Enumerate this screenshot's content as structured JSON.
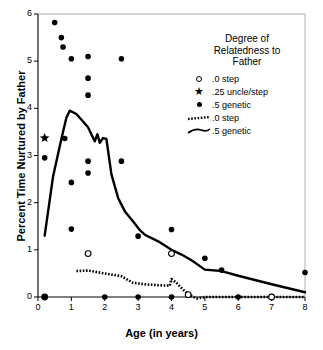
{
  "chart_data": {
    "type": "scatter",
    "title": "",
    "xlabel": "Age (in years)",
    "ylabel": "Percent Time Nurtured by Father",
    "xlim": [
      0,
      8
    ],
    "ylim": [
      0,
      6
    ],
    "xticks": [
      0,
      1,
      2,
      3,
      4,
      5,
      6,
      7,
      8
    ],
    "yticks": [
      0,
      1,
      2,
      3,
      4,
      5,
      6
    ],
    "xtick_labels": [
      "0",
      "1",
      "2",
      "3",
      "4",
      "5",
      "6",
      "7",
      "8"
    ],
    "ytick_labels": [
      "0",
      "1",
      "2",
      "3",
      "4",
      "5",
      "6"
    ],
    "grid": false,
    "legend_position": "upper-right",
    "legend_title": "Degree of\nRelatedness to\nFather",
    "series": [
      {
        "name": ".0 step",
        "marker": "open-circle",
        "type": "scatter",
        "points": [
          [
            0.2,
            0.0
          ],
          [
            1.5,
            0.92
          ],
          [
            4.0,
            0.92
          ],
          [
            4.5,
            0.05
          ],
          [
            7.0,
            0.0
          ]
        ]
      },
      {
        "name": ".25 uncle/step",
        "marker": "star",
        "type": "scatter",
        "points": [
          [
            0.2,
            3.37
          ]
        ]
      },
      {
        "name": ".5 genetic",
        "marker": "filled-circle",
        "type": "scatter",
        "points": [
          [
            0.2,
            0.0
          ],
          [
            0.2,
            2.95
          ],
          [
            0.5,
            5.82
          ],
          [
            0.7,
            5.5
          ],
          [
            0.75,
            5.3
          ],
          [
            0.8,
            3.36
          ],
          [
            1.0,
            5.05
          ],
          [
            1.0,
            2.43
          ],
          [
            1.0,
            1.44
          ],
          [
            1.5,
            5.1
          ],
          [
            1.5,
            4.64
          ],
          [
            1.5,
            4.28
          ],
          [
            1.5,
            2.88
          ],
          [
            1.5,
            2.63
          ],
          [
            2.0,
            0.0
          ],
          [
            2.5,
            5.05
          ],
          [
            2.5,
            2.88
          ],
          [
            3.0,
            1.29
          ],
          [
            3.0,
            0.0
          ],
          [
            4.0,
            1.43
          ],
          [
            4.0,
            0.0
          ],
          [
            5.0,
            0.82
          ],
          [
            5.5,
            0.57
          ],
          [
            6.0,
            0.0
          ],
          [
            8.0,
            0.52
          ]
        ]
      },
      {
        "name": ".0 step",
        "marker": "dotted-line",
        "type": "line",
        "points": [
          [
            1.15,
            0.55
          ],
          [
            1.5,
            0.56
          ],
          [
            2.0,
            0.5
          ],
          [
            2.5,
            0.44
          ],
          [
            2.85,
            0.3
          ],
          [
            3.2,
            0.27
          ],
          [
            3.6,
            0.25
          ],
          [
            3.95,
            0.24
          ],
          [
            4.0,
            0.38
          ],
          [
            4.15,
            0.3
          ],
          [
            4.4,
            0.12
          ],
          [
            4.55,
            0.04
          ],
          [
            4.75,
            -0.03
          ],
          [
            5.0,
            0.0
          ],
          [
            6.0,
            0.0
          ],
          [
            7.0,
            0.0
          ],
          [
            8.0,
            0.0
          ]
        ]
      },
      {
        "name": ".5 genetic",
        "marker": "solid-line",
        "type": "line",
        "points": [
          [
            0.2,
            1.3
          ],
          [
            0.45,
            2.55
          ],
          [
            0.7,
            3.35
          ],
          [
            0.85,
            3.8
          ],
          [
            0.95,
            3.95
          ],
          [
            1.15,
            3.88
          ],
          [
            1.35,
            3.72
          ],
          [
            1.5,
            3.6
          ],
          [
            1.62,
            3.42
          ],
          [
            1.7,
            3.3
          ],
          [
            1.78,
            3.45
          ],
          [
            1.85,
            3.27
          ],
          [
            1.95,
            3.37
          ],
          [
            2.05,
            3.35
          ],
          [
            2.2,
            2.6
          ],
          [
            2.4,
            2.1
          ],
          [
            2.6,
            1.82
          ],
          [
            2.85,
            1.6
          ],
          [
            3.05,
            1.42
          ],
          [
            3.2,
            1.32
          ],
          [
            3.6,
            1.18
          ],
          [
            4.0,
            1.0
          ],
          [
            4.3,
            0.9
          ],
          [
            4.6,
            0.78
          ],
          [
            5.0,
            0.58
          ],
          [
            5.5,
            0.55
          ],
          [
            6.0,
            0.45
          ],
          [
            7.0,
            0.27
          ],
          [
            8.0,
            0.1
          ]
        ]
      }
    ],
    "legend_entries": [
      {
        "label": ".0 step",
        "symbol": "open-circle"
      },
      {
        "label": ".25 uncle/step",
        "symbol": "star"
      },
      {
        "label": ".5 genetic",
        "symbol": "filled-circle"
      },
      {
        "label": ".0 step",
        "symbol": "dotted-line"
      },
      {
        "label": ".5 genetic",
        "symbol": "solid-line"
      }
    ]
  },
  "legend": {
    "title": "Degree of\nRelatedness to\nFather"
  },
  "axes": {
    "x_title": "Age (in years)",
    "y_title": "Percent Time Nurtured by Father"
  },
  "colors": {
    "foreground": "#000000",
    "background": "#ffffff"
  }
}
